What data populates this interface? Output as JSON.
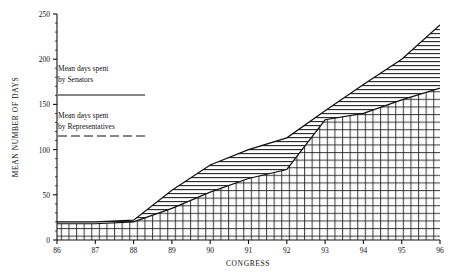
{
  "chart_data": {
    "type": "area",
    "title": "",
    "subtitle": "",
    "xlabel": "CONGRESS",
    "ylabel": "MEAN NUMBER OF DAYS",
    "x": [
      86,
      87,
      88,
      89,
      90,
      91,
      92,
      93,
      94,
      95,
      96
    ],
    "categories": [
      "86",
      "87",
      "88",
      "89",
      "90",
      "91",
      "92",
      "93",
      "94",
      "95",
      "96"
    ],
    "xlim": [
      86,
      96
    ],
    "ylim": [
      0,
      250
    ],
    "xticks": [
      "86",
      "87",
      "88",
      "89",
      "90",
      "91",
      "92",
      "93",
      "94",
      "95",
      "96"
    ],
    "yticks": [
      "0",
      "50",
      "100",
      "150",
      "200",
      "250"
    ],
    "ytick_values": [
      0,
      50,
      100,
      150,
      200,
      250
    ],
    "y_minor_step": 10,
    "grid": false,
    "legend_position": "upper-left-inside",
    "series": [
      {
        "name": "Mean days spent by Senators",
        "line_style": "solid",
        "fill": "horizontal-hatch",
        "values": [
          20,
          20,
          22,
          55,
          83,
          100,
          113,
          143,
          172,
          200,
          238
        ]
      },
      {
        "name": "Mean days spent by Representatives",
        "line_style": "dashed",
        "fill": "cross-hatch",
        "values": [
          18,
          18,
          20,
          35,
          53,
          68,
          78,
          133,
          140,
          155,
          168
        ]
      }
    ]
  },
  "legend": {
    "senators": {
      "line1": "Mean days spent",
      "line2": "by Senators",
      "style": "solid"
    },
    "representatives": {
      "line1": "Mean days spent",
      "line2": "by Representatives",
      "style": "dashed"
    }
  },
  "colors": {
    "ink": "#111111",
    "background": "#ffffff",
    "senator_band": "#555555",
    "representative_band": "#333333"
  }
}
